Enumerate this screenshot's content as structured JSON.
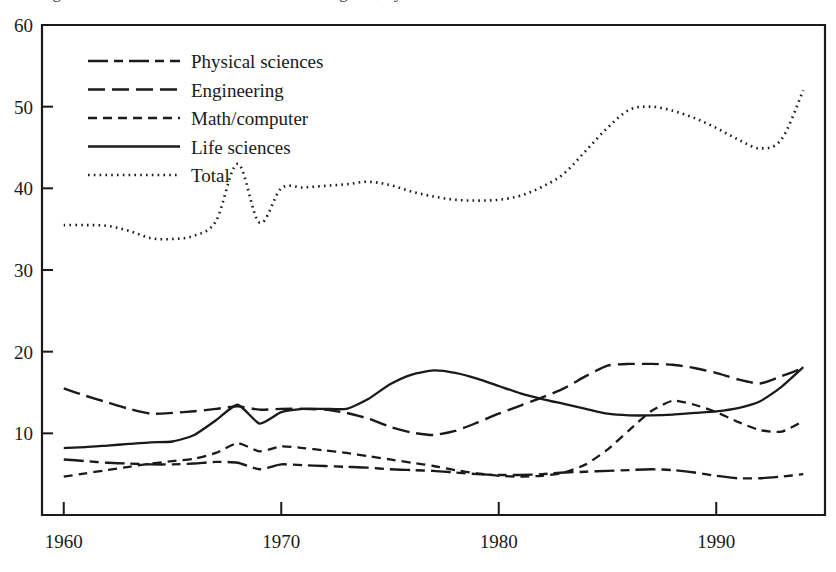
{
  "figure": {
    "clipped_title_fragment": "Figure. Ratio of doctorates to bachelor's degrees, by field",
    "background_color": "#ffffff",
    "ink_color": "#1a1a1a"
  },
  "chart_data": {
    "type": "line",
    "title": "",
    "xlabel": "",
    "ylabel": "",
    "xlim": [
      1959,
      1995
    ],
    "ylim": [
      0,
      60
    ],
    "xticks": [
      1960,
      1970,
      1980,
      1990
    ],
    "yticks": [
      10,
      20,
      30,
      40,
      50,
      60
    ],
    "xtick_labels": [
      "1960",
      "1970",
      "1980",
      "1990"
    ],
    "ytick_labels": [
      "10",
      "20",
      "30",
      "40",
      "50",
      "60"
    ],
    "grid": false,
    "legend_position": "upper-left-inside",
    "x": [
      1960,
      1961,
      1962,
      1963,
      1964,
      1965,
      1966,
      1967,
      1968,
      1969,
      1970,
      1971,
      1972,
      1973,
      1974,
      1975,
      1976,
      1977,
      1978,
      1979,
      1980,
      1981,
      1982,
      1983,
      1984,
      1985,
      1986,
      1987,
      1988,
      1989,
      1990,
      1991,
      1992,
      1993,
      1994
    ],
    "series": [
      {
        "name": "Physical sciences",
        "line_style": "dash-dot",
        "values": [
          6.8,
          6.6,
          6.4,
          6.3,
          6.2,
          6.2,
          6.3,
          6.5,
          6.4,
          5.6,
          6.2,
          6.1,
          6.0,
          5.9,
          5.8,
          5.6,
          5.5,
          5.4,
          5.2,
          5.0,
          4.9,
          4.9,
          5.0,
          5.2,
          5.3,
          5.4,
          5.5,
          5.6,
          5.5,
          5.2,
          4.8,
          4.5,
          4.5,
          4.7,
          5.0
        ]
      },
      {
        "name": "Engineering",
        "line_style": "long-dash",
        "values": [
          15.5,
          14.6,
          13.8,
          13.0,
          12.4,
          12.5,
          12.7,
          13.0,
          13.3,
          12.9,
          13.0,
          13.0,
          12.9,
          12.5,
          11.8,
          10.8,
          10.1,
          9.8,
          10.3,
          11.3,
          12.4,
          13.4,
          14.4,
          15.5,
          17.0,
          18.3,
          18.5,
          18.5,
          18.4,
          18.0,
          17.4,
          16.6,
          16.1,
          17.0,
          18.0
        ]
      },
      {
        "name": "Math/computer",
        "line_style": "short-dash",
        "values": [
          4.7,
          5.1,
          5.5,
          5.9,
          6.3,
          6.6,
          6.9,
          7.6,
          8.8,
          7.8,
          8.4,
          8.2,
          7.9,
          7.6,
          7.2,
          6.8,
          6.4,
          6.0,
          5.5,
          5.1,
          4.8,
          4.7,
          4.8,
          5.2,
          6.2,
          8.0,
          10.4,
          12.7,
          14.0,
          13.5,
          12.6,
          11.4,
          10.4,
          10.2,
          11.5
        ]
      },
      {
        "name": "Life sciences",
        "line_style": "solid",
        "values": [
          8.2,
          8.3,
          8.5,
          8.7,
          8.9,
          9.0,
          9.8,
          11.6,
          13.5,
          11.2,
          12.6,
          13.0,
          13.0,
          13.0,
          14.2,
          16.0,
          17.2,
          17.7,
          17.4,
          16.7,
          15.8,
          14.9,
          14.2,
          13.6,
          13.0,
          12.4,
          12.2,
          12.2,
          12.3,
          12.5,
          12.7,
          13.1,
          13.9,
          15.7,
          18.1
        ]
      },
      {
        "name": "Total",
        "line_style": "dotted",
        "values": [
          35.5,
          35.5,
          35.4,
          34.8,
          33.9,
          33.8,
          34.2,
          36.0,
          43.0,
          35.8,
          40.0,
          40.1,
          40.3,
          40.5,
          40.8,
          40.4,
          39.6,
          39.0,
          38.6,
          38.5,
          38.6,
          39.1,
          40.2,
          41.8,
          44.6,
          47.4,
          49.6,
          50.0,
          49.5,
          48.6,
          47.4,
          46.0,
          44.9,
          46.0,
          52.0
        ]
      }
    ]
  },
  "legend": {
    "items": [
      {
        "label": "Physical sciences",
        "style": "dash-dot"
      },
      {
        "label": "Engineering",
        "style": "long-dash"
      },
      {
        "label": "Math/computer",
        "style": "short-dash"
      },
      {
        "label": "Life sciences",
        "style": "solid"
      },
      {
        "label": "Total",
        "style": "dotted"
      }
    ]
  }
}
